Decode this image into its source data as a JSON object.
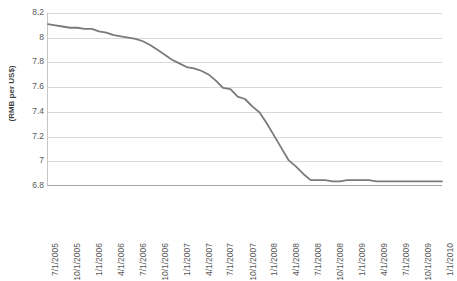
{
  "chart_data": {
    "type": "line",
    "title": "",
    "subtitle": "",
    "xlabel": "",
    "ylabel": "(RMB per US$)",
    "ylim": [
      6.8,
      8.2
    ],
    "ytick_labels": [
      "8.2",
      "8",
      "7.8",
      "7.6",
      "7.4",
      "7.2",
      "7",
      "6.8"
    ],
    "ytick_values": [
      8.2,
      8.0,
      7.8,
      7.6,
      7.4,
      7.2,
      7.0,
      6.8
    ],
    "grid": "horizontal",
    "legend": "none",
    "line_color": "#7a7a7a",
    "gridline_color": "#d9d9d9",
    "axis_color": "#a6a6a6",
    "categories": [
      "7/1/2005",
      "10/1/2005",
      "1/1/2006",
      "4/1/2006",
      "7/1/2006",
      "10/1/2006",
      "1/1/2007",
      "4/1/2007",
      "7/1/2007",
      "10/1/2007",
      "1/1/2008",
      "4/1/2008",
      "7/1/2008",
      "10/1/2008",
      "1/1/2009",
      "4/1/2009",
      "7/1/2009",
      "10/1/2009",
      "1/1/2010"
    ],
    "series": [
      {
        "name": "RMB per US$",
        "x": [
          "7/1/2005",
          "8/1/2005",
          "9/1/2005",
          "10/1/2005",
          "11/1/2005",
          "12/1/2005",
          "1/1/2006",
          "2/1/2006",
          "3/1/2006",
          "4/1/2006",
          "5/1/2006",
          "6/1/2006",
          "7/1/2006",
          "8/1/2006",
          "9/1/2006",
          "10/1/2006",
          "11/1/2006",
          "12/1/2006",
          "1/1/2007",
          "2/1/2007",
          "3/1/2007",
          "4/1/2007",
          "5/1/2007",
          "6/1/2007",
          "7/1/2007",
          "8/1/2007",
          "9/1/2007",
          "10/1/2007",
          "11/1/2007",
          "12/1/2007",
          "1/1/2008",
          "2/1/2008",
          "3/1/2008",
          "4/1/2008",
          "5/1/2008",
          "6/1/2008",
          "7/1/2008",
          "8/1/2008",
          "9/1/2008",
          "10/1/2008",
          "11/1/2008",
          "12/1/2008",
          "1/1/2009",
          "2/1/2009",
          "3/1/2009",
          "4/1/2009",
          "5/1/2009",
          "6/1/2009",
          "7/1/2009",
          "8/1/2009",
          "9/1/2009",
          "10/1/2009",
          "11/1/2009",
          "12/1/2009",
          "1/1/2010"
        ],
        "values": [
          8.11,
          8.1,
          8.09,
          8.08,
          8.08,
          8.07,
          8.07,
          8.05,
          8.04,
          8.02,
          8.01,
          8.0,
          7.99,
          7.97,
          7.94,
          7.9,
          7.86,
          7.82,
          7.79,
          7.76,
          7.75,
          7.73,
          7.7,
          7.65,
          7.59,
          7.58,
          7.52,
          7.5,
          7.44,
          7.39,
          7.3,
          7.2,
          7.1,
          7.0,
          6.95,
          6.89,
          6.84,
          6.84,
          6.84,
          6.83,
          6.83,
          6.84,
          6.84,
          6.84,
          6.84,
          6.83,
          6.83,
          6.83,
          6.83,
          6.83,
          6.83,
          6.83,
          6.83,
          6.83,
          6.83
        ]
      }
    ]
  }
}
